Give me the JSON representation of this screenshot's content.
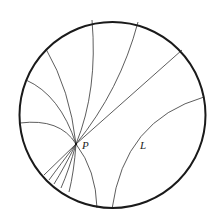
{
  "diagram": {
    "type": "poincare-disk",
    "colors": {
      "stroke": "#222222",
      "boundary": "#1a1a1a",
      "background": "#ffffff"
    },
    "disk": {
      "cx": 112.5,
      "cy": 115,
      "r": 93
    },
    "point_P": {
      "x": 76,
      "y": 144,
      "label": "P"
    },
    "line_L": {
      "label": "L",
      "label_x": 140,
      "label_y": 149
    },
    "labels": {
      "p": "P",
      "l": "L"
    }
  }
}
